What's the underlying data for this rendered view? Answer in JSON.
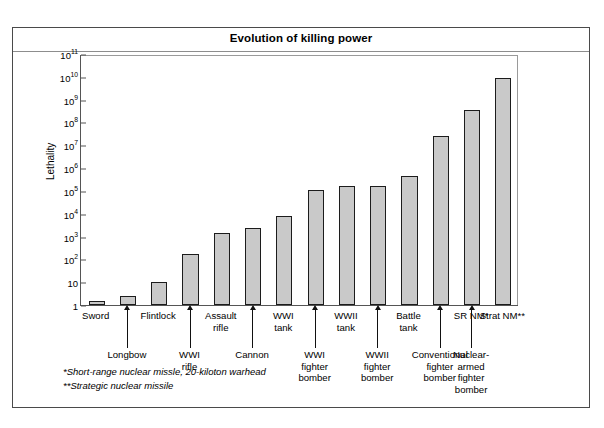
{
  "chart_data": {
    "type": "bar",
    "title": "Evolution of killing power",
    "xlabel": "",
    "ylabel": "Lethality",
    "yscale": "log",
    "ylim": [
      1,
      100000000000
    ],
    "grid": false,
    "legend": null,
    "ytick_labels": [
      "10¹¹",
      "10¹⁰",
      "10⁹",
      "10⁸",
      "10⁷",
      "10⁶",
      "10⁵",
      "10⁴",
      "10³",
      "10²",
      "10",
      "1"
    ],
    "ytick_values": [
      100000000000,
      10000000000,
      1000000000,
      100000000,
      10000000,
      1000000,
      100000,
      10000,
      1000,
      100,
      10,
      1
    ],
    "categories": [
      "Sword",
      "Longbow",
      "WWI rifle",
      "Cannon",
      "WWI tank",
      "WWII tank",
      "WWI fighter bomber",
      "WWII fighter bomber",
      "Battle tank",
      "Conventional fighter bomber",
      "SR NM*",
      "Nuclear-armed fighter bomber",
      "Strat NM**",
      "Strat NM**"
    ],
    "values": [
      1.5,
      2.5,
      10,
      180,
      1500,
      2300,
      8000,
      110000,
      160000,
      170000,
      450000,
      25000000,
      350000000,
      9000000000
    ],
    "bar_color": "#c9c9c9",
    "bar_edge_color": "#1c1c1c",
    "annotations": [
      "*Short-range nuclear missle, 20-kiloton warhead",
      "**Strategic nuclear missile"
    ]
  },
  "axis_labels": {
    "row0": [
      {
        "text": "Sword",
        "bar": 0
      },
      {
        "text": "Flintlock",
        "bar": 2
      },
      {
        "text": "Assault\nrifle",
        "bar": 4
      },
      {
        "text": "WWI\ntank",
        "bar": 6
      },
      {
        "text": "WWII\ntank",
        "bar": 8
      },
      {
        "text": "Battle\ntank",
        "bar": 10
      },
      {
        "text": "SR NM*",
        "bar": 12
      },
      {
        "text": "Strat NM**",
        "bar": 13
      }
    ],
    "row1": [
      {
        "text": "Longbow",
        "bar": 1
      },
      {
        "text": "WWI\nrifle",
        "bar": 3
      },
      {
        "text": "Cannon",
        "bar": 5
      },
      {
        "text": "WWI\nfighter\nbomber",
        "bar": 7
      },
      {
        "text": "WWII\nfighter\nbomber",
        "bar": 9
      },
      {
        "text": "Conventional\nfighter\nbomber",
        "bar": 11
      },
      {
        "text": "Nuclear-\narmed\nfighter\nbomber",
        "bar": 12
      }
    ]
  },
  "footnotes": {
    "note1": "*Short-range nuclear missle, 20-kiloton warhead",
    "note2": "**Strategic nuclear missile"
  }
}
